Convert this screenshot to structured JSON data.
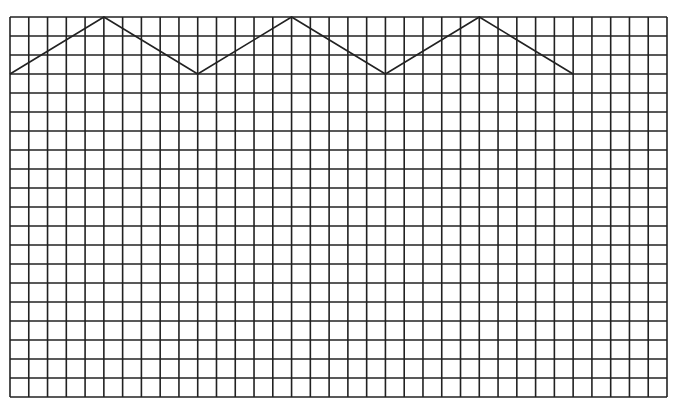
{
  "diagram": {
    "type": "grid-with-zigzag",
    "grid": {
      "columns": 35,
      "rows": 20,
      "left": 10,
      "top": 17,
      "right": 667,
      "bottom": 397,
      "line_color": "#222222",
      "line_width": 1.6
    },
    "zigzag": {
      "color": "#222222",
      "line_width": 1.6,
      "points_grid": [
        [
          0,
          3
        ],
        [
          5,
          0
        ],
        [
          10,
          3
        ],
        [
          15,
          0
        ],
        [
          20,
          3
        ],
        [
          25,
          0
        ],
        [
          30,
          3
        ]
      ]
    },
    "background": "#ffffff"
  }
}
